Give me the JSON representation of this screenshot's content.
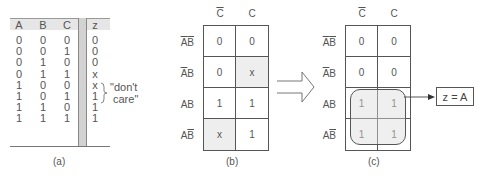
{
  "truth_table": {
    "caption": "(a)",
    "headers": [
      "A",
      "B",
      "C",
      "z"
    ],
    "rows": [
      [
        "0",
        "0",
        "0",
        "0"
      ],
      [
        "0",
        "0",
        "1",
        "0"
      ],
      [
        "0",
        "1",
        "0",
        "0"
      ],
      [
        "0",
        "1",
        "1",
        "x"
      ],
      [
        "1",
        "0",
        "0",
        "x"
      ],
      [
        "1",
        "0",
        "1",
        "1"
      ],
      [
        "1",
        "1",
        "0",
        "1"
      ],
      [
        "1",
        "1",
        "1",
        "1"
      ]
    ],
    "annotation_line1": "\"don't",
    "annotation_line2": "care\""
  },
  "kmap_b": {
    "caption": "(b)",
    "col_labels": [
      "C",
      "C"
    ],
    "col_overline": [
      true,
      false
    ],
    "row_labels": [
      {
        "a": "A",
        "a_bar": true,
        "b": "B",
        "b_bar": true
      },
      {
        "a": "A",
        "a_bar": true,
        "b": "B",
        "b_bar": false
      },
      {
        "a": "A",
        "a_bar": false,
        "b": "B",
        "b_bar": false
      },
      {
        "a": "A",
        "a_bar": false,
        "b": "B",
        "b_bar": true
      }
    ],
    "cells": [
      [
        "0",
        "0"
      ],
      [
        "0",
        "x"
      ],
      [
        "1",
        "1"
      ],
      [
        "x",
        "1"
      ]
    ],
    "shaded": [
      [
        false,
        false
      ],
      [
        false,
        true
      ],
      [
        false,
        false
      ],
      [
        true,
        false
      ]
    ]
  },
  "kmap_c": {
    "caption": "(c)",
    "col_labels": [
      "C",
      "C"
    ],
    "cells": [
      [
        "0",
        "0"
      ],
      [
        "0",
        "0"
      ],
      [
        "1",
        "1"
      ],
      [
        "1",
        "1"
      ]
    ],
    "result": "z = A"
  }
}
